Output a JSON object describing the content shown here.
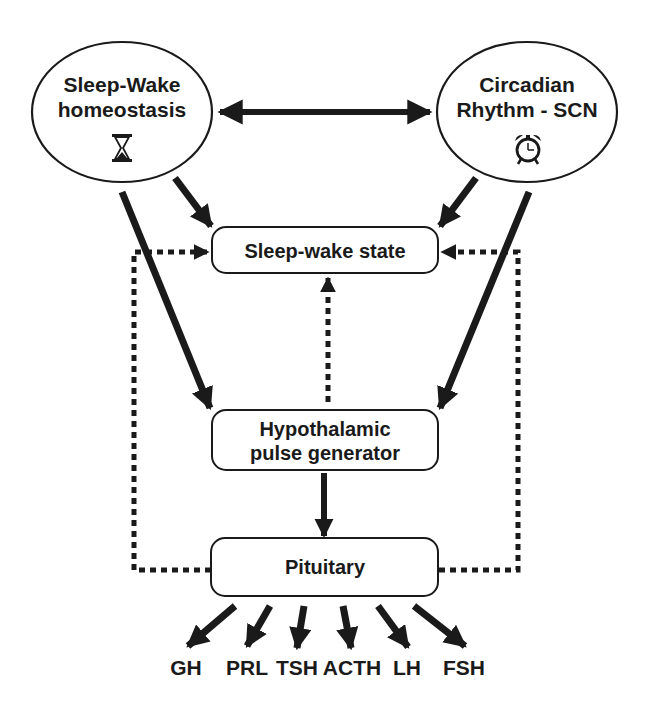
{
  "diagram": {
    "nodes": {
      "homeostasis": {
        "line1": "Sleep-Wake",
        "line2": "homeostasis",
        "icon": "hourglass-icon"
      },
      "circadian": {
        "line1": "Circadian",
        "line2": "Rhythm - SCN",
        "icon": "alarm-clock-icon"
      },
      "sleep_wake_state": {
        "label": "Sleep-wake state"
      },
      "hypothalamic": {
        "line1": "Hypothalamic",
        "line2": "pulse generator"
      },
      "pituitary": {
        "label": "Pituitary"
      }
    },
    "outputs": [
      {
        "label": "GH"
      },
      {
        "label": "PRL"
      },
      {
        "label": "TSH"
      },
      {
        "label": "ACTH"
      },
      {
        "label": "LH"
      },
      {
        "label": "FSH"
      }
    ],
    "edges": [
      {
        "from": "homeostasis",
        "to": "circadian",
        "style": "solid",
        "bidirectional": true
      },
      {
        "from": "homeostasis",
        "to": "sleep_wake_state",
        "style": "solid"
      },
      {
        "from": "circadian",
        "to": "sleep_wake_state",
        "style": "solid"
      },
      {
        "from": "homeostasis",
        "to": "hypothalamic",
        "style": "solid"
      },
      {
        "from": "circadian",
        "to": "hypothalamic",
        "style": "solid"
      },
      {
        "from": "hypothalamic",
        "to": "sleep_wake_state",
        "style": "dotted"
      },
      {
        "from": "hypothalamic",
        "to": "pituitary",
        "style": "solid"
      },
      {
        "from": "pituitary",
        "to": "sleep_wake_state",
        "style": "dotted",
        "side": "left"
      },
      {
        "from": "pituitary",
        "to": "sleep_wake_state",
        "style": "dotted",
        "side": "right"
      },
      {
        "from": "pituitary",
        "to": "GH",
        "style": "solid"
      },
      {
        "from": "pituitary",
        "to": "PRL",
        "style": "solid"
      },
      {
        "from": "pituitary",
        "to": "TSH",
        "style": "solid"
      },
      {
        "from": "pituitary",
        "to": "ACTH",
        "style": "solid"
      },
      {
        "from": "pituitary",
        "to": "LH",
        "style": "solid"
      },
      {
        "from": "pituitary",
        "to": "FSH",
        "style": "solid"
      }
    ],
    "colors": {
      "ink": "#1a1a1a",
      "background": "#ffffff"
    }
  }
}
